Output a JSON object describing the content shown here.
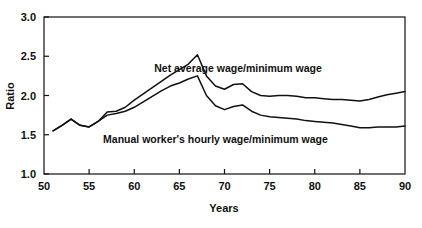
{
  "chart_data": {
    "type": "line",
    "title": "",
    "xlabel": "Years",
    "ylabel": "Ratio",
    "xlim": [
      50,
      90
    ],
    "ylim": [
      1.0,
      3.0
    ],
    "xticks": [
      50,
      55,
      60,
      65,
      70,
      75,
      80,
      85,
      90
    ],
    "xtick_labels": [
      "50",
      "55",
      "60",
      "65",
      "70",
      "75",
      "80",
      "85",
      "90"
    ],
    "yticks": [
      1.0,
      1.5,
      2.0,
      2.5,
      3.0
    ],
    "ytick_labels": [
      "1.0",
      "1.5",
      "2.0",
      "2.5",
      "3.0"
    ],
    "grid": false,
    "legend_position": "inline-annotation",
    "line_color": "#111111",
    "series": [
      {
        "name": "Net average wage/minimum wage",
        "label_position": {
          "x": 71.5,
          "y": 2.3
        },
        "x": [
          51,
          52,
          53,
          54,
          55,
          56,
          57,
          58,
          59,
          60,
          61,
          62,
          63,
          64,
          65,
          66,
          67,
          68,
          69,
          70,
          71,
          72,
          73,
          74,
          75,
          76,
          77,
          78,
          79,
          80,
          81,
          82,
          83,
          84,
          85,
          86,
          87,
          88,
          89,
          90
        ],
        "values": [
          1.55,
          1.62,
          1.7,
          1.62,
          1.6,
          1.67,
          1.79,
          1.8,
          1.85,
          1.94,
          2.02,
          2.1,
          2.18,
          2.26,
          2.33,
          2.4,
          2.52,
          2.25,
          2.12,
          2.08,
          2.14,
          2.15,
          2.05,
          2.0,
          1.99,
          2.0,
          2.0,
          1.99,
          1.97,
          1.97,
          1.96,
          1.95,
          1.95,
          1.94,
          1.93,
          1.95,
          1.98,
          2.01,
          2.03,
          2.05
        ]
      },
      {
        "name": "Manual worker's hourly wage/minimum wage",
        "label_position": {
          "x": 69.0,
          "y": 1.4
        },
        "x": [
          51,
          52,
          53,
          54,
          55,
          56,
          57,
          58,
          59,
          60,
          61,
          62,
          63,
          64,
          65,
          66,
          67,
          68,
          69,
          70,
          71,
          72,
          73,
          74,
          75,
          76,
          77,
          78,
          79,
          80,
          81,
          82,
          83,
          84,
          85,
          86,
          87,
          88,
          89,
          90
        ],
        "values": [
          1.55,
          1.62,
          1.7,
          1.62,
          1.6,
          1.67,
          1.75,
          1.77,
          1.8,
          1.85,
          1.92,
          1.99,
          2.06,
          2.12,
          2.16,
          2.21,
          2.25,
          2.0,
          1.87,
          1.82,
          1.86,
          1.88,
          1.8,
          1.75,
          1.73,
          1.72,
          1.71,
          1.7,
          1.68,
          1.67,
          1.66,
          1.65,
          1.63,
          1.61,
          1.59,
          1.59,
          1.6,
          1.6,
          1.6,
          1.61
        ]
      }
    ]
  },
  "axes": {
    "y_axis_title": "Ratio",
    "x_axis_title": "Years"
  }
}
